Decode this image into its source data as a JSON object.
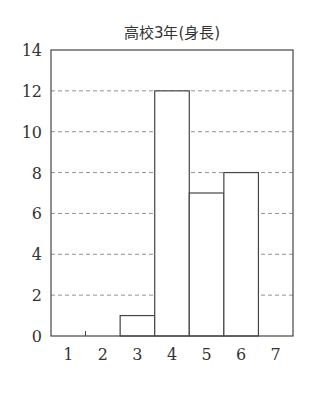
{
  "chart_data": {
    "type": "bar",
    "title": "高校3年(身長)",
    "xlabel": "",
    "ylabel": "",
    "categories": [
      "1",
      "2",
      "3",
      "4",
      "5",
      "6",
      "7"
    ],
    "values": [
      0,
      0,
      1,
      12,
      7,
      8,
      0
    ],
    "ylim": [
      0,
      14
    ],
    "yticks": [
      0,
      2,
      4,
      6,
      8,
      10,
      12,
      14
    ],
    "grid": "dashed horizontal",
    "legend": "none",
    "bar_style": {
      "fill": "#ffffff",
      "stroke": "#444444"
    }
  }
}
